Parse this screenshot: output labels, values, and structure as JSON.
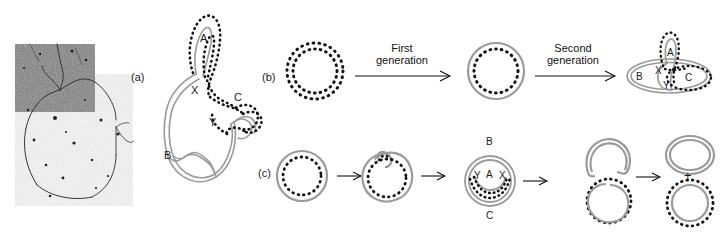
{
  "figure": {
    "caption_panels": [
      "(a)",
      "(b)",
      "(c)"
    ],
    "background": "#ffffff",
    "colors": {
      "dna_gray": "#9a9a9a",
      "dna_dotted": "#111111",
      "text": "#1a1a1a"
    }
  },
  "panel_a": {
    "label": "(a)",
    "micrograph": {
      "name": "electron-micrograph",
      "description": "electron micrograph of replicating DNA with dark upper-left field and light lower-right field",
      "dark_tone": "#6b6b6b",
      "light_tone": "#efefef"
    },
    "diagram_labels": {
      "A": "A",
      "B": "B",
      "C": "C",
      "X": "X",
      "Y": "Y"
    }
  },
  "panel_b": {
    "label": "(b)",
    "arrow1_text_line1": "First",
    "arrow1_text_line2": "generation",
    "arrow2_text_line1": "Second",
    "arrow2_text_line2": "generation",
    "stage1_name": "double-dotted-circle",
    "stage2_name": "gray-outer-dotted-inner-circle",
    "stage3_labels": {
      "A": "A",
      "B": "B",
      "C": "C",
      "X": "X",
      "Y": "Y"
    }
  },
  "panel_c": {
    "label": "(c)",
    "stage1_name": "gray-outer-dotted-inner-circle",
    "stage2_name": "circle-with-bud",
    "stage3_labels": {
      "A": "A",
      "B": "B",
      "C": "C",
      "X": "X",
      "Y": "Y"
    },
    "stage4_name": "two-joined-circles",
    "stage5_name": "two-separated-circles",
    "plus_sign": "+"
  }
}
